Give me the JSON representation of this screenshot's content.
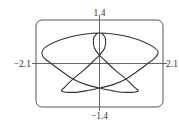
{
  "chart_data": {
    "type": "line",
    "subtype": "parametric-curve",
    "title": "",
    "xlabel": "",
    "ylabel": "",
    "xlim": [
      -2.1,
      2.1
    ],
    "ylim": [
      -1.4,
      1.4
    ],
    "grid": false,
    "legend": null,
    "axis_labels": {
      "top": "1.4",
      "bottom": "−1.4",
      "left": "−2.1",
      "right": "2.1"
    },
    "series": [
      {
        "name": "curve",
        "color": "#333333",
        "closed": true,
        "points": [
          [
            0.0,
            0.98
          ],
          [
            0.45,
            0.95
          ],
          [
            0.95,
            0.86
          ],
          [
            1.45,
            0.7
          ],
          [
            1.8,
            0.52
          ],
          [
            1.94,
            0.37
          ],
          [
            1.85,
            0.2
          ],
          [
            1.6,
            0.0
          ],
          [
            1.25,
            -0.25
          ],
          [
            0.88,
            -0.5
          ],
          [
            0.45,
            -0.68
          ],
          [
            0.0,
            -0.79
          ],
          [
            -0.45,
            -0.88
          ],
          [
            -0.85,
            -0.93
          ],
          [
            -1.24,
            -0.89
          ],
          [
            -1.15,
            -0.76
          ],
          [
            -0.88,
            -0.5
          ],
          [
            -0.5,
            -0.2
          ],
          [
            -0.2,
            0.08
          ],
          [
            0.0,
            0.27
          ],
          [
            0.17,
            0.5
          ],
          [
            0.2,
            0.78
          ],
          [
            0.12,
            0.93
          ],
          [
            0.0,
            0.98
          ],
          [
            -0.12,
            0.93
          ],
          [
            -0.2,
            0.78
          ],
          [
            -0.17,
            0.5
          ],
          [
            0.0,
            0.27
          ],
          [
            0.2,
            0.08
          ],
          [
            0.5,
            -0.2
          ],
          [
            0.88,
            -0.5
          ],
          [
            1.15,
            -0.76
          ],
          [
            1.27,
            -0.89
          ],
          [
            0.85,
            -0.93
          ],
          [
            0.45,
            -0.88
          ],
          [
            0.0,
            -0.79
          ],
          [
            -0.45,
            -0.68
          ],
          [
            -0.88,
            -0.5
          ],
          [
            -1.25,
            -0.25
          ],
          [
            -1.6,
            0.0
          ],
          [
            -1.85,
            0.2
          ],
          [
            -1.9,
            0.37
          ],
          [
            -1.8,
            0.52
          ],
          [
            -1.45,
            0.7
          ],
          [
            -0.95,
            0.86
          ],
          [
            -0.45,
            0.95
          ],
          [
            0.0,
            0.98
          ]
        ]
      }
    ]
  },
  "colors": {
    "curve": "#333333",
    "axes": "#555555",
    "frame": "#555555",
    "background": "#ffffff"
  }
}
